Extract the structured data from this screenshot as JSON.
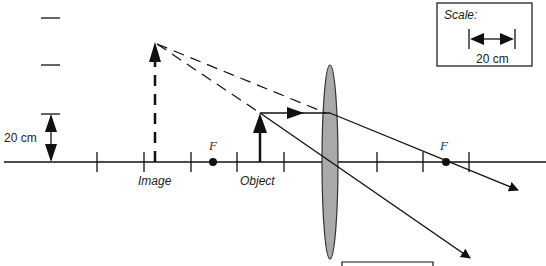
{
  "diagram": {
    "type": "ray-diagram-converging-lens",
    "labels": {
      "image": "Image",
      "object": "Object",
      "focal_left": "F",
      "focal_right": "F",
      "vertical_scale": "20 cm"
    },
    "scale_box": {
      "title": "Scale:",
      "value": "20 cm"
    },
    "colors": {
      "line": "#111111",
      "lens_fill": "#a9a9a9",
      "lens_stroke": "#333333"
    }
  }
}
